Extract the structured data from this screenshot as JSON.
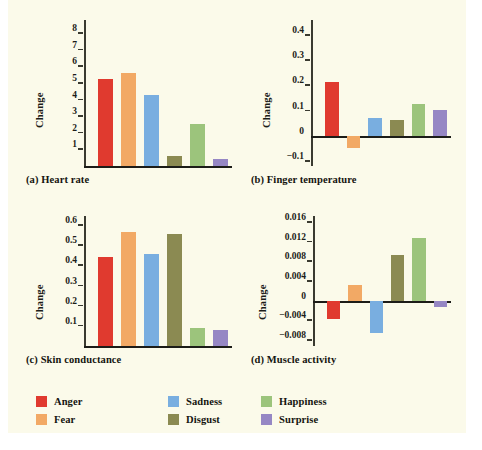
{
  "figure": {
    "background": "#fbfaea",
    "axis_label": "Change"
  },
  "series_colors": {
    "Anger": "#e03a2f",
    "Fear": "#f2a965",
    "Sadness": "#79aee0",
    "Disgust": "#8b8a52",
    "Happiness": "#9cc47c",
    "Surprise": "#9687c4"
  },
  "legend": {
    "items": [
      {
        "label": "Anger",
        "color": "#e03a2f"
      },
      {
        "label": "Fear",
        "color": "#f2a965"
      },
      {
        "label": "Sadness",
        "color": "#79aee0"
      },
      {
        "label": "Disgust",
        "color": "#8b8a52"
      },
      {
        "label": "Happiness",
        "color": "#9cc47c"
      },
      {
        "label": "Surprise",
        "color": "#9687c4"
      }
    ]
  },
  "chart_data": [
    {
      "type": "bar",
      "panel": "a",
      "title": "(a) Heart rate",
      "ylabel": "Change",
      "xlabel": "",
      "categories": [
        "Anger",
        "Fear",
        "Sadness",
        "Disgust",
        "Happiness",
        "Surprise"
      ],
      "values": [
        5.25,
        5.6,
        4.3,
        0.6,
        2.55,
        0.45
      ],
      "ticks": [
        "1",
        "2",
        "3",
        "4",
        "5",
        "6",
        "7",
        "8"
      ],
      "tickvals": [
        1,
        2,
        3,
        4,
        5,
        6,
        7,
        8
      ],
      "ylim": [
        0,
        8.8
      ],
      "grid": false,
      "legend_position": "bottom"
    },
    {
      "type": "bar",
      "panel": "b",
      "title": "(b) Finger temperature",
      "ylabel": "Change",
      "xlabel": "",
      "categories": [
        "Anger",
        "Fear",
        "Sadness",
        "Disgust",
        "Happiness",
        "Surprise"
      ],
      "values": [
        0.215,
        -0.048,
        0.072,
        0.062,
        0.128,
        0.102
      ],
      "ticks": [
        "0.4",
        "0.3",
        "0.2",
        "0.1",
        "0",
        "−0.1"
      ],
      "tickvals": [
        0.4,
        0.3,
        0.2,
        0.1,
        0,
        -0.1
      ],
      "ylim": [
        -0.12,
        0.46
      ],
      "grid": false,
      "legend_position": "bottom"
    },
    {
      "type": "bar",
      "panel": "c",
      "title": "(c) Skin conductance",
      "ylabel": "Change",
      "xlabel": "",
      "categories": [
        "Anger",
        "Fear",
        "Sadness",
        "Disgust",
        "Happiness",
        "Surprise"
      ],
      "values": [
        0.44,
        0.565,
        0.455,
        0.555,
        0.09,
        0.08
      ],
      "ticks": [
        "0.1",
        "0.2",
        "0.3",
        "0.4",
        "0.5",
        "0.6"
      ],
      "tickvals": [
        0.1,
        0.2,
        0.3,
        0.4,
        0.5,
        0.6
      ],
      "ylim": [
        0,
        0.645
      ],
      "grid": false,
      "legend_position": "bottom"
    },
    {
      "type": "bar",
      "panel": "d",
      "title": "(d) Muscle activity",
      "ylabel": "Change",
      "xlabel": "",
      "categories": [
        "Anger",
        "Fear",
        "Sadness",
        "Disgust",
        "Happiness",
        "Surprise"
      ],
      "values": [
        -0.0038,
        0.0032,
        -0.0065,
        0.0093,
        0.0128,
        -0.0013
      ],
      "ticks": [
        "0.016",
        "0.012",
        "0.008",
        "0.004",
        "0",
        "−0.004",
        "−0.008"
      ],
      "tickvals": [
        0.016,
        0.012,
        0.008,
        0.004,
        0,
        -0.004,
        -0.008
      ],
      "ylim": [
        -0.0092,
        0.0172
      ],
      "grid": false,
      "legend_position": "bottom"
    }
  ]
}
